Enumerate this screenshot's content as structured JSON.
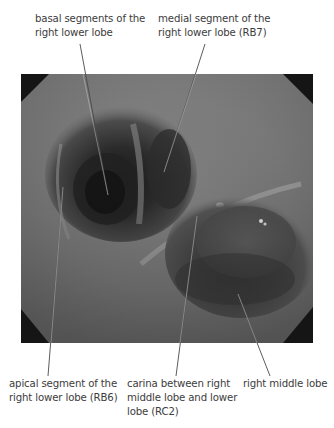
{
  "figure": {
    "image_description": "bronchoscopic view of right lower lobe and right middle lobe orifices",
    "labels": {
      "top_left": {
        "lines": [
          "basal segments of the",
          "right lower lobe"
        ]
      },
      "top_right": {
        "lines": [
          "medial segment of the",
          "right lower lobe (RB7)"
        ]
      },
      "bottom_left": {
        "lines": [
          "apical segment of the",
          "right lower lobe (RB6)"
        ]
      },
      "bottom_middle": {
        "lines": [
          "carina between right",
          "middle lobe and lower",
          "lobe (RC2)"
        ]
      },
      "bottom_right": {
        "lines": [
          "right middle lobe"
        ]
      }
    },
    "colors": {
      "text": "#3c3c3c",
      "leader_line": "#4a4a4a",
      "frame_corner": "#151515",
      "background": "#ffffff"
    }
  }
}
